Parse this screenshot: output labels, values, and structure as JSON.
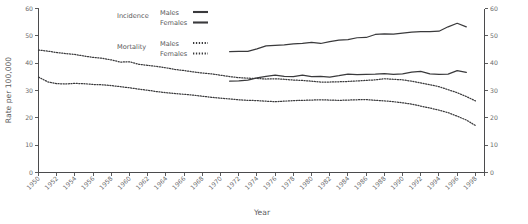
{
  "chart_data": {
    "type": "line",
    "title": "",
    "xlabel": "Year",
    "ylabel": "Rate per 100,000",
    "xlim": [
      1950,
      1999
    ],
    "ylim": [
      0,
      60
    ],
    "grid": false,
    "legend_position": "top-center",
    "y_ticks": [
      0,
      10,
      20,
      30,
      40,
      50,
      60
    ],
    "y_tick_labels": [
      "0",
      "10",
      "20",
      "30",
      "40",
      "50",
      "60"
    ],
    "right_axis": true,
    "right_y_ticks": [
      0,
      10,
      20,
      30,
      40,
      50,
      60
    ],
    "right_y_tick_labels": [
      "0",
      "10",
      "20",
      "30",
      "40",
      "50",
      "60"
    ],
    "x_ticks": [
      1950,
      1952,
      1954,
      1956,
      1958,
      1960,
      1962,
      1964,
      1966,
      1968,
      1970,
      1972,
      1974,
      1976,
      1978,
      1980,
      1982,
      1984,
      1986,
      1988,
      1990,
      1992,
      1994,
      1996,
      1998
    ],
    "x_tick_labels": [
      "1950",
      "1952",
      "1954",
      "1956",
      "1958",
      "1960",
      "1962",
      "1964",
      "1966",
      "1968",
      "1970",
      "1972",
      "1974",
      "1976",
      "1978",
      "1980",
      "1982",
      "1984",
      "1986",
      "1988",
      "1990",
      "1992",
      "1994",
      "1996",
      "1998"
    ],
    "legend_groups": [
      {
        "group_label": "Incidence",
        "entries": [
          {
            "label": "Males",
            "style": "solid"
          },
          {
            "label": "Females",
            "style": "solid"
          }
        ]
      },
      {
        "group_label": "Mortality",
        "entries": [
          {
            "label": "Males",
            "style": "dotted"
          },
          {
            "label": "Females",
            "style": "dotted"
          }
        ]
      }
    ],
    "series": [
      {
        "name": "Incidence Males",
        "group": "Incidence",
        "style": "solid",
        "x": [
          1971,
          1972,
          1973,
          1974,
          1975,
          1976,
          1977,
          1978,
          1979,
          1980,
          1981,
          1982,
          1983,
          1984,
          1985,
          1986,
          1987,
          1988,
          1989,
          1990,
          1991,
          1992,
          1993,
          1994,
          1995,
          1996,
          1997
        ],
        "values": [
          44.2,
          44.3,
          44.3,
          45.2,
          46.3,
          46.5,
          46.7,
          47.1,
          47.2,
          47.6,
          47.2,
          47.9,
          48.4,
          48.6,
          49.3,
          49.4,
          50.5,
          50.7,
          50.6,
          51.0,
          51.4,
          51.5,
          51.5,
          51.7,
          53.3,
          54.6,
          53.3
        ]
      },
      {
        "name": "Incidence Females",
        "group": "Incidence",
        "style": "solid",
        "x": [
          1971,
          1972,
          1973,
          1974,
          1975,
          1976,
          1977,
          1978,
          1979,
          1980,
          1981,
          1982,
          1983,
          1984,
          1985,
          1986,
          1987,
          1988,
          1989,
          1990,
          1991,
          1992,
          1993,
          1994,
          1995,
          1996,
          1997
        ],
        "values": [
          33.4,
          33.5,
          33.8,
          34.6,
          35.2,
          35.6,
          35.2,
          35.1,
          35.6,
          35.1,
          35.2,
          34.9,
          35.4,
          36.0,
          35.8,
          35.9,
          36.0,
          36.2,
          35.9,
          36.1,
          36.7,
          37.0,
          36.1,
          35.9,
          36.0,
          37.3,
          36.6
        ]
      },
      {
        "name": "Mortality Males",
        "group": "Mortality",
        "style": "dotted",
        "x": [
          1950,
          1951,
          1952,
          1953,
          1954,
          1955,
          1956,
          1957,
          1958,
          1959,
          1960,
          1961,
          1962,
          1963,
          1964,
          1965,
          1966,
          1967,
          1968,
          1969,
          1970,
          1971,
          1972,
          1973,
          1974,
          1975,
          1976,
          1977,
          1978,
          1979,
          1980,
          1981,
          1982,
          1983,
          1984,
          1985,
          1986,
          1987,
          1988,
          1989,
          1990,
          1991,
          1992,
          1993,
          1994,
          1995,
          1996,
          1997,
          1998
        ],
        "values": [
          44.8,
          44.4,
          43.9,
          43.5,
          43.2,
          42.6,
          42.1,
          41.8,
          41.2,
          40.4,
          40.5,
          39.6,
          39.2,
          38.8,
          38.3,
          37.7,
          37.3,
          36.8,
          36.4,
          36.1,
          35.6,
          35.1,
          34.7,
          34.5,
          34.4,
          34.2,
          34.3,
          34.1,
          33.8,
          33.7,
          33.4,
          33.1,
          33.1,
          33.2,
          33.3,
          33.5,
          33.7,
          33.9,
          34.3,
          34.1,
          33.9,
          33.4,
          32.8,
          32.1,
          31.4,
          30.3,
          29.2,
          27.8,
          26.2
        ]
      },
      {
        "name": "Mortality Females",
        "group": "Mortality",
        "style": "dotted",
        "x": [
          1950,
          1951,
          1952,
          1953,
          1954,
          1955,
          1956,
          1957,
          1958,
          1959,
          1960,
          1961,
          1962,
          1963,
          1964,
          1965,
          1966,
          1967,
          1968,
          1969,
          1970,
          1971,
          1972,
          1973,
          1974,
          1975,
          1976,
          1977,
          1978,
          1979,
          1980,
          1981,
          1982,
          1983,
          1984,
          1985,
          1986,
          1987,
          1988,
          1989,
          1990,
          1991,
          1992,
          1993,
          1994,
          1995,
          1996,
          1997,
          1998
        ],
        "values": [
          34.9,
          33.2,
          32.5,
          32.4,
          32.6,
          32.5,
          32.2,
          32.1,
          31.8,
          31.4,
          31.0,
          30.5,
          30.1,
          29.6,
          29.2,
          28.9,
          28.6,
          28.3,
          27.9,
          27.5,
          27.2,
          26.9,
          26.6,
          26.4,
          26.3,
          26.1,
          25.9,
          26.1,
          26.3,
          26.4,
          26.5,
          26.6,
          26.5,
          26.4,
          26.5,
          26.6,
          26.7,
          26.4,
          26.2,
          25.9,
          25.5,
          25.0,
          24.3,
          23.6,
          22.8,
          21.9,
          20.6,
          19.2,
          17.2
        ]
      }
    ]
  }
}
